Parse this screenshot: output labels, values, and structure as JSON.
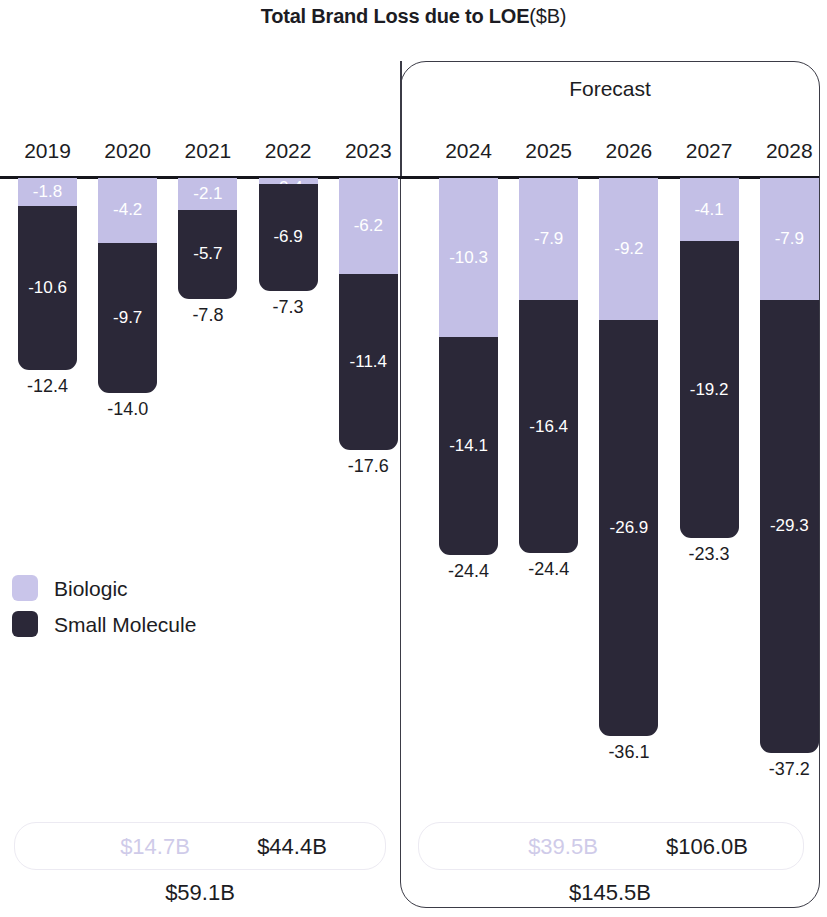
{
  "title": {
    "main": "Total Brand Loss due to LOE",
    "unit": "($B)"
  },
  "forecast": {
    "label": "Forecast"
  },
  "legend": {
    "items": [
      {
        "label": "Biologic",
        "color": "#c9c5ea"
      },
      {
        "label": "Small Molecule",
        "color": "#2b2838"
      }
    ]
  },
  "summary": {
    "historical": {
      "biologic": "$14.7B",
      "small_molecule": "$44.4B",
      "total": "$59.1B"
    },
    "forecast": {
      "biologic": "$39.5B",
      "small_molecule": "$106.0B",
      "total": "$145.5B"
    }
  },
  "chart_data": {
    "type": "bar",
    "xlabel": "",
    "ylabel": "Brand Loss ($B)",
    "ylim": [
      -40,
      0
    ],
    "grid": false,
    "legend_position": "left-middle",
    "stacked": true,
    "orientation": "vertical-negative",
    "categories": [
      "2019",
      "2020",
      "2021",
      "2022",
      "2023",
      "2024",
      "2025",
      "2026",
      "2027",
      "2028"
    ],
    "series": [
      {
        "name": "Biologic",
        "color": "#c3bfe6",
        "values": [
          -1.8,
          -4.2,
          -2.1,
          -0.4,
          -6.2,
          -10.3,
          -7.9,
          -9.2,
          -4.1,
          -7.9
        ]
      },
      {
        "name": "Small Molecule",
        "color": "#2b2838",
        "values": [
          -10.6,
          -9.7,
          -5.7,
          -6.9,
          -11.4,
          -14.1,
          -16.4,
          -26.9,
          -19.2,
          -29.3
        ]
      }
    ],
    "totals": [
      -12.4,
      -14.0,
      -7.8,
      -7.3,
      -17.6,
      -24.4,
      -24.4,
      -36.1,
      -23.3,
      -37.2
    ],
    "annotations": {
      "forecast_region": {
        "label": "Forecast",
        "categories": [
          "2024",
          "2025",
          "2026",
          "2027",
          "2028"
        ]
      },
      "historical_region": {
        "categories": [
          "2019",
          "2020",
          "2021",
          "2022",
          "2023"
        ]
      }
    },
    "bar_labels": {
      "biologic": [
        "-1.8",
        "-4.2",
        "-2.1",
        "-0.4",
        "-6.2",
        "-10.3",
        "-7.9",
        "-9.2",
        "-4.1",
        "-7.9"
      ],
      "small_molecule": [
        "-10.6",
        "-9.7",
        "-5.7",
        "-6.9",
        "-11.4",
        "-14.1",
        "-16.4",
        "-26.9",
        "-19.2",
        "-29.3"
      ],
      "total": [
        "-12.4",
        "-14.0",
        "-7.8",
        "-7.3",
        "-17.6",
        "-24.4",
        "-24.4",
        "-36.1",
        "-23.3",
        "-37.2"
      ]
    }
  }
}
